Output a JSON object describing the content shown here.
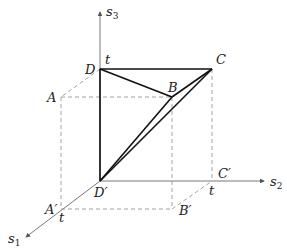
{
  "diagram": {
    "type": "3d-coordinate-cube",
    "axes": [
      {
        "id": "s1",
        "label": "s",
        "sub": "1"
      },
      {
        "id": "s2",
        "label": "s",
        "sub": "2"
      },
      {
        "id": "s3",
        "label": "s",
        "sub": "3"
      }
    ],
    "points": {
      "A": "A",
      "B": "B",
      "C": "C",
      "D": "D",
      "A_prime": "A′",
      "B_prime": "B′",
      "C_prime": "C′",
      "D_prime": "D′"
    },
    "tick_labels": {
      "t_s3": "t",
      "t_s1": "t",
      "t_s2": "t"
    },
    "colors": {
      "axis": "#555555",
      "solid": "#111111",
      "dashed": "#8a8a8a"
    }
  }
}
